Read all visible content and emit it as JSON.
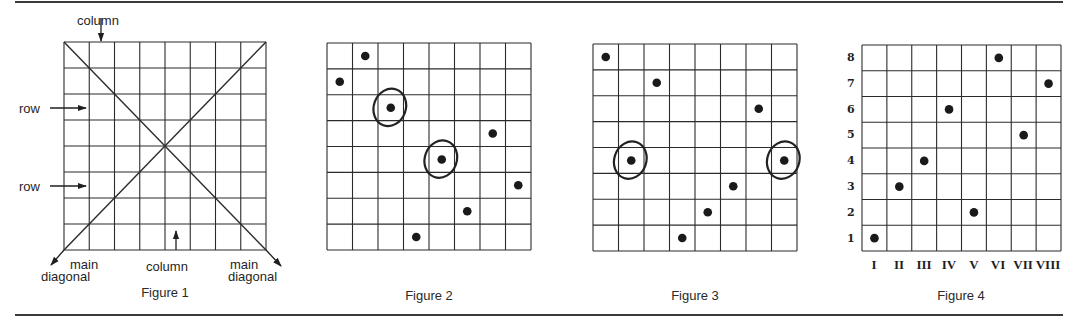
{
  "figures": [
    {
      "id": "figure-1",
      "caption": "Figure 1",
      "grid": {
        "x": 64,
        "y": 42,
        "w": 202,
        "h": 208,
        "cols": 8,
        "rows": 8
      },
      "diagonals": true,
      "labels": {
        "column_top": "column",
        "column_bottom": "column",
        "row_1": "row",
        "row_2": "row",
        "main_left_1": "main",
        "main_left_2": "diagonal",
        "main_right_1": "main",
        "main_right_2": "diagonal"
      },
      "queens": []
    },
    {
      "id": "figure-2",
      "caption": "Figure 2",
      "grid": {
        "x": 327,
        "y": 43,
        "w": 204,
        "h": 207,
        "cols": 8,
        "rows": 8
      },
      "queens": [
        {
          "col": 1,
          "row": 2,
          "circled": false
        },
        {
          "col": 2,
          "row": 1,
          "circled": false
        },
        {
          "col": 3,
          "row": 3,
          "circled": true
        },
        {
          "col": 4,
          "row": 8,
          "circled": false
        },
        {
          "col": 5,
          "row": 5,
          "circled": true
        },
        {
          "col": 6,
          "row": 7,
          "circled": false
        },
        {
          "col": 7,
          "row": 4,
          "circled": false
        },
        {
          "col": 8,
          "row": 6,
          "circled": false
        }
      ]
    },
    {
      "id": "figure-3",
      "caption": "Figure 3",
      "grid": {
        "x": 593,
        "y": 44,
        "w": 204,
        "h": 207,
        "cols": 8,
        "rows": 8
      },
      "queens": [
        {
          "col": 1,
          "row": 1,
          "circled": false
        },
        {
          "col": 2,
          "row": 5,
          "circled": true
        },
        {
          "col": 3,
          "row": 2,
          "circled": false
        },
        {
          "col": 4,
          "row": 8,
          "circled": false
        },
        {
          "col": 5,
          "row": 7,
          "circled": false
        },
        {
          "col": 6,
          "row": 6,
          "circled": false
        },
        {
          "col": 7,
          "row": 3,
          "circled": false
        },
        {
          "col": 8,
          "row": 5,
          "circled": true
        }
      ]
    },
    {
      "id": "figure-4",
      "caption": "Figure 4",
      "grid": {
        "x": 862,
        "y": 45,
        "w": 199,
        "h": 206,
        "cols": 8,
        "rows": 8
      },
      "row_numbers": [
        "8",
        "7",
        "6",
        "5",
        "4",
        "3",
        "2",
        "1"
      ],
      "column_numerals": [
        "I",
        "II",
        "III",
        "IV",
        "V",
        "VI",
        "VII",
        "VIII"
      ],
      "queens_by_column_row_from_bottom": [
        1,
        3,
        4,
        6,
        2,
        8,
        5,
        7
      ]
    }
  ],
  "style": {
    "line_color": "#2b2b2b",
    "dot_color": "#1a1a1a",
    "circle_color": "#222222"
  }
}
